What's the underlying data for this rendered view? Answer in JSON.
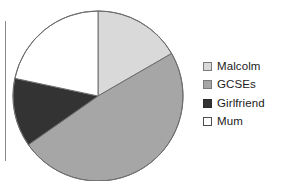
{
  "figure": {
    "background_color": "#ffffff",
    "left_rule_color": "#8c8c8c"
  },
  "legend": {
    "position": "right",
    "items": [
      {
        "label": "Malcolm",
        "color": "#d9d9d9",
        "border": "#7a7a7a"
      },
      {
        "label": "GCSEs",
        "color": "#a6a6a6",
        "border": "#7a7a7a"
      },
      {
        "label": "Girlfriend",
        "color": "#333333",
        "border": "#2b2b2b"
      },
      {
        "label": "Mum",
        "color": "#ffffff",
        "border": "#4d4d4d"
      }
    ]
  },
  "chart_data": {
    "type": "pie",
    "title": "",
    "xlabel": "",
    "ylabel": "",
    "legend_position": "right",
    "grid": false,
    "start_angle_deg": 0,
    "direction": "clockwise",
    "center_px": [
      98,
      96
    ],
    "radius_px": 85,
    "categories": [
      "Malcolm",
      "GCSEs",
      "Girlfriend",
      "Mum"
    ],
    "values": [
      17,
      48,
      13,
      22
    ],
    "units": "percent",
    "colors": [
      "#d9d9d9",
      "#a6a6a6",
      "#333333",
      "#ffffff"
    ],
    "slice_angles_deg": [
      {
        "name": "Malcolm",
        "start": 0,
        "end": 60,
        "sweep": 60
      },
      {
        "name": "GCSEs",
        "start": 60,
        "end": 235,
        "sweep": 175
      },
      {
        "name": "Girlfriend",
        "start": 235,
        "end": 282,
        "sweep": 47
      },
      {
        "name": "Mum",
        "start": 282,
        "end": 360,
        "sweep": 78
      }
    ],
    "outline_color": "#6e6e6e",
    "data_labels_shown": false
  }
}
